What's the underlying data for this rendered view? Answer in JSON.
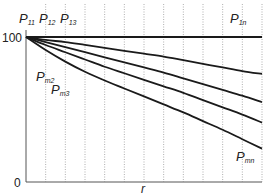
{
  "chart_data": {
    "type": "line",
    "title": "",
    "xlabel": "r",
    "ylabel": "",
    "ylim": [
      0,
      100
    ],
    "yticks": [
      "0",
      "100"
    ],
    "grid": {
      "vertical": true,
      "horizontal": false,
      "style": "dotted",
      "count": 12
    },
    "x": [
      0,
      1,
      2,
      3,
      4,
      5,
      6,
      7,
      8,
      9,
      10,
      11,
      12
    ],
    "series": [
      {
        "name": "P1n",
        "values": [
          100,
          100,
          100,
          100,
          100,
          100,
          100,
          100,
          100,
          100,
          100,
          100,
          100
        ]
      },
      {
        "name": "curve-2",
        "values": [
          100,
          98,
          96.5,
          94.5,
          92.5,
          90.5,
          88.5,
          86.5,
          84,
          81.5,
          79,
          76.5,
          74.5
        ]
      },
      {
        "name": "curve-3",
        "values": [
          100,
          96.5,
          93,
          89.5,
          86,
          82.5,
          79,
          75.5,
          71.5,
          67.5,
          63.5,
          59.5,
          55
        ]
      },
      {
        "name": "curve-4",
        "values": [
          100,
          94.5,
          89.5,
          84.5,
          79.5,
          75,
          70.5,
          66,
          61.5,
          56.5,
          51.5,
          46.5,
          41
        ]
      },
      {
        "name": "Pmn",
        "values": [
          100,
          91,
          83,
          76,
          70,
          64.5,
          59,
          53.5,
          48,
          42,
          36,
          29.5,
          23
        ]
      }
    ],
    "annotations": [
      {
        "text": "P",
        "sub": "11",
        "position": "top"
      },
      {
        "text": "P",
        "sub": "12",
        "position": "top"
      },
      {
        "text": "P",
        "sub": "13",
        "position": "top"
      },
      {
        "text": "P",
        "sub": "1n",
        "position": "top"
      },
      {
        "text": "P",
        "sub": "m2",
        "position": "left"
      },
      {
        "text": "P",
        "sub": "m3",
        "position": "left"
      },
      {
        "text": "P",
        "sub": "mn",
        "position": "bottom-right"
      }
    ]
  },
  "labels": {
    "p11": {
      "main": "P",
      "sub": "11"
    },
    "p12": {
      "main": "P",
      "sub": "12"
    },
    "p13": {
      "main": "P",
      "sub": "13"
    },
    "p1n": {
      "main": "P",
      "sub": "1n"
    },
    "pm2": {
      "main": "P",
      "sub": "m2"
    },
    "pm3": {
      "main": "P",
      "sub": "m3"
    },
    "pmn": {
      "main": "P",
      "sub": "mn"
    },
    "y_top": "100",
    "y_bottom": "0",
    "x_axis": "r"
  },
  "colors": {
    "line": "#1a1a1a",
    "grid": "#9a9a9a",
    "axis": "#555555"
  }
}
